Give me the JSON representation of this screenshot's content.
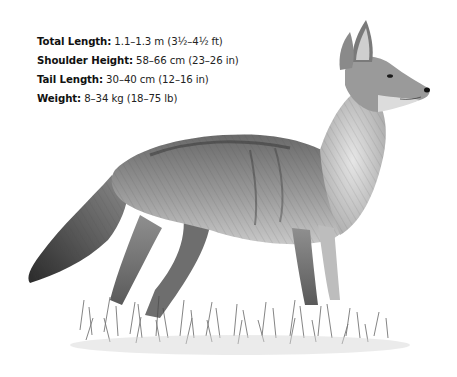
{
  "specs": [
    {
      "label": "Total Length:",
      "value": " 1.1–1.3 m (3½–4½ ft)"
    },
    {
      "label": "Shoulder Height:",
      "value": " 58–66 cm (23–26 in)"
    },
    {
      "label": "Tail Length:",
      "value": " 30–40 cm (12–16 in)"
    },
    {
      "label": "Weight:",
      "value": " 8–34 kg (18–75 lb)"
    }
  ],
  "illustration": {
    "subject": "coyote",
    "style": "grayscale pencil drawing",
    "description": "Coyote standing in profile facing right on a patch of grass"
  }
}
